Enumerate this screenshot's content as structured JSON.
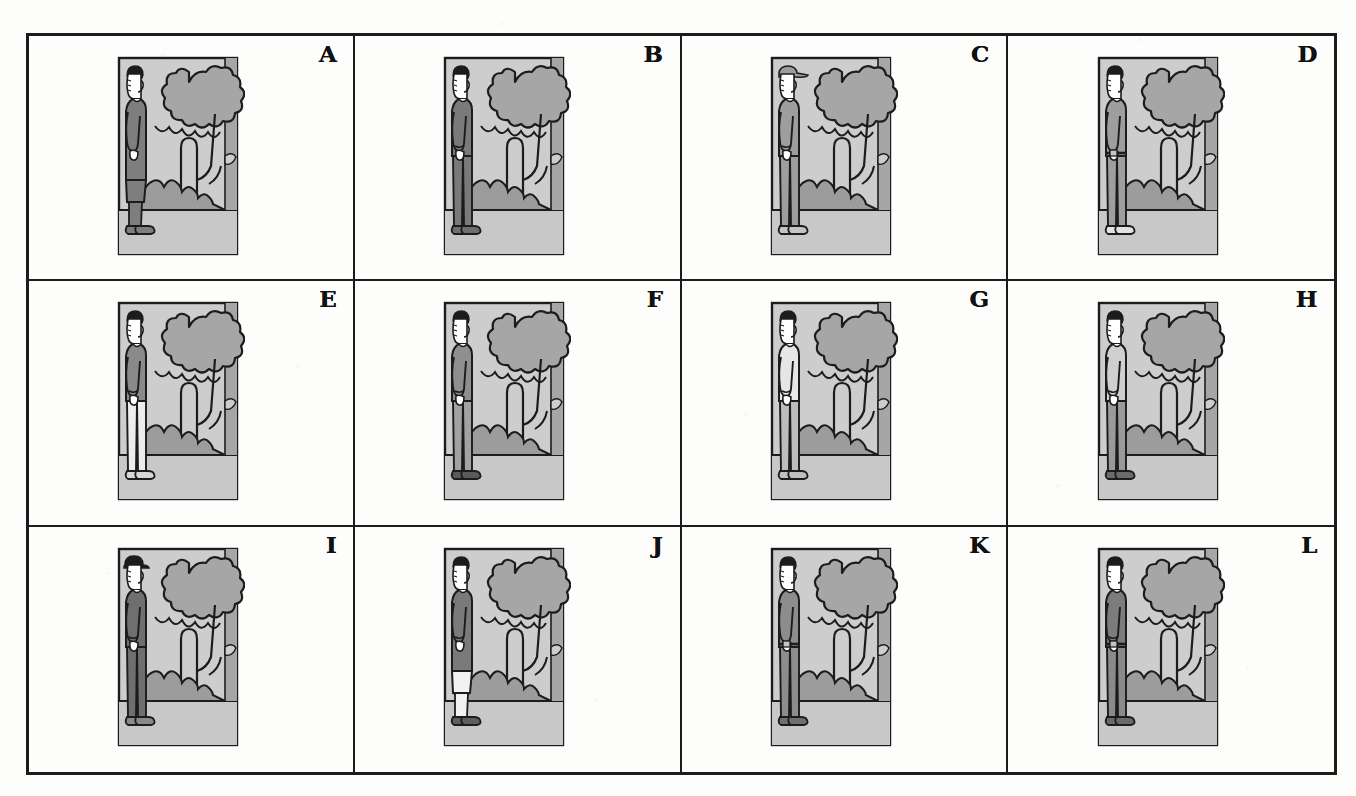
{
  "page": {
    "kind": "figure-plate",
    "background_color": "#fdfdfc",
    "ink_color": "#1c1c1c",
    "grid": {
      "columns": 4,
      "rows": 3,
      "cell_count": 12
    }
  },
  "palette": {
    "ink": "#1c1c1c",
    "sky": "#cdcdcd",
    "foliage": "#a6a6a6",
    "bush": "#9c9c9c",
    "ground": "#c8c8c8",
    "garment_dark": "#7e7e7e",
    "garment_mid": "#9e9e9e",
    "garment_light": "#c4c4c4",
    "skin": "#ffffff",
    "paper": "#fdfdfc"
  },
  "panels": [
    {
      "letter": "A",
      "row": 1,
      "column": 1,
      "figure": "woman in long dark dress and heeled shoes, facing right",
      "headwear": "none",
      "top_tone": "#7e7e7e",
      "bottom_tone": "#7e7e7e",
      "shoe_tone": "#7e7e7e",
      "long_garment": true,
      "has_sleeve_cuff": false,
      "has_belt": false
    },
    {
      "letter": "B",
      "row": 1,
      "column": 2,
      "figure": "man in dark suit jacket and trousers, facing right",
      "headwear": "none",
      "top_tone": "#7a7a7a",
      "bottom_tone": "#7a7a7a",
      "shoe_tone": "#6f6f6f",
      "long_garment": false,
      "has_sleeve_cuff": true,
      "has_belt": false
    },
    {
      "letter": "C",
      "row": 1,
      "column": 3,
      "figure": "man in cap wearing mid-tone jacket and trousers, facing right",
      "headwear": "cap",
      "top_tone": "#9e9e9e",
      "bottom_tone": "#9e9e9e",
      "shoe_tone": "#c4c4c4",
      "long_garment": false,
      "has_sleeve_cuff": true,
      "has_belt": false
    },
    {
      "letter": "D",
      "row": 1,
      "column": 4,
      "figure": "man in short-sleeve shirt, jeans and sneakers, facing right",
      "headwear": "none",
      "top_tone": "#9e9e9e",
      "bottom_tone": "#9e9e9e",
      "shoe_tone": "#e2e2e2",
      "long_garment": false,
      "has_sleeve_cuff": false,
      "has_belt": true
    },
    {
      "letter": "E",
      "row": 2,
      "column": 1,
      "figure": "figure with dark jacket and pale trousers, facing right",
      "headwear": "none",
      "top_tone": "#8a8a8a",
      "bottom_tone": "#ededed",
      "shoe_tone": "#d6d6d6",
      "long_garment": false,
      "has_sleeve_cuff": true,
      "has_belt": false
    },
    {
      "letter": "F",
      "row": 2,
      "column": 2,
      "figure": "man in mid-tone jacket and trousers with dark shoes, facing right",
      "headwear": "none",
      "top_tone": "#8f8f8f",
      "bottom_tone": "#a2a2a2",
      "shoe_tone": "#5a5a5a",
      "long_garment": false,
      "has_sleeve_cuff": true,
      "has_belt": false
    },
    {
      "letter": "G",
      "row": 2,
      "column": 3,
      "figure": "man in pale light suit and light shoes, facing right",
      "headwear": "none",
      "top_tone": "#e6e6e6",
      "bottom_tone": "#bdbdbd",
      "shoe_tone": "#c0c0c0",
      "long_garment": false,
      "has_sleeve_cuff": true,
      "has_belt": false
    },
    {
      "letter": "H",
      "row": 2,
      "column": 4,
      "figure": "man in light jacket with dark trousers and boots, facing right",
      "headwear": "none",
      "top_tone": "#cfcfcf",
      "bottom_tone": "#9a9a9a",
      "shoe_tone": "#6b6b6b",
      "long_garment": false,
      "has_sleeve_cuff": true,
      "has_belt": false
    },
    {
      "letter": "I",
      "row": 3,
      "column": 1,
      "figure": "man in bowler hat and dark suit, facing right",
      "headwear": "bowler-hat",
      "top_tone": "#6f6f6f",
      "bottom_tone": "#6f6f6f",
      "shoe_tone": "#8a8a8a",
      "long_garment": false,
      "has_sleeve_cuff": true,
      "has_belt": false
    },
    {
      "letter": "J",
      "row": 3,
      "column": 2,
      "figure": "figure in long dark coat with pale legs and dark shoes, facing right",
      "headwear": "none",
      "top_tone": "#7a7a7a",
      "bottom_tone": "#f2f2f2",
      "shoe_tone": "#5e5e5e",
      "long_garment": true,
      "has_sleeve_cuff": true,
      "has_belt": false
    },
    {
      "letter": "K",
      "row": 3,
      "column": 3,
      "figure": "man in short-sleeve shirt and trousers carrying a camera at the waist, facing right",
      "headwear": "none",
      "top_tone": "#8d8d8d",
      "bottom_tone": "#8d8d8d",
      "shoe_tone": "#707070",
      "long_garment": false,
      "has_sleeve_cuff": false,
      "has_belt": true
    },
    {
      "letter": "L",
      "row": 3,
      "column": 4,
      "figure": "man in dark overcoat and dark trousers with boots, facing right",
      "headwear": "none",
      "top_tone": "#7c7c7c",
      "bottom_tone": "#8a8a8a",
      "shoe_tone": "#6a6a6a",
      "long_garment": false,
      "has_sleeve_cuff": true,
      "has_belt": true
    }
  ]
}
